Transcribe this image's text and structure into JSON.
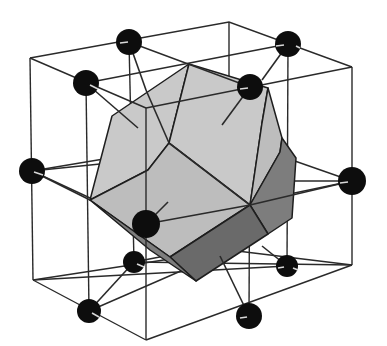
{
  "figure": {
    "colors": {
      "background": "#ffffff",
      "cube_edges": "#2a2a2a",
      "atom": "#0d0d0d",
      "face_light": "#c9c9c9",
      "face_dark": "#7d7d7d"
    },
    "atoms": [
      {
        "id": "top-back",
        "x": 129,
        "y": 42,
        "r": 13
      },
      {
        "id": "top-right-back",
        "x": 288,
        "y": 44,
        "r": 13
      },
      {
        "id": "top-left-front",
        "x": 86,
        "y": 83,
        "r": 13
      },
      {
        "id": "top-right-front",
        "x": 250,
        "y": 87,
        "r": 13
      },
      {
        "id": "left-mid",
        "x": 32,
        "y": 171,
        "r": 13
      },
      {
        "id": "right-mid",
        "x": 352,
        "y": 181,
        "r": 14
      },
      {
        "id": "front-center",
        "x": 146,
        "y": 224,
        "r": 14
      },
      {
        "id": "lower-left",
        "x": 134,
        "y": 262,
        "r": 11
      },
      {
        "id": "lower-right",
        "x": 287,
        "y": 266,
        "r": 11
      },
      {
        "id": "bottom-left",
        "x": 89,
        "y": 311,
        "r": 12
      },
      {
        "id": "bottom-right",
        "x": 249,
        "y": 316,
        "r": 13
      }
    ],
    "labels": []
  }
}
